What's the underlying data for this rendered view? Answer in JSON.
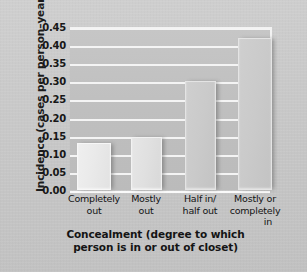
{
  "chart_data": {
    "type": "bar",
    "title": "",
    "xlabel": "Concealment (degree to which person is in or out of closet)",
    "ylabel": "Incidence (cases per person–year)",
    "categories": [
      "Completely out",
      "Mostly out",
      "Half in/ half out",
      "Mostly or completely in"
    ],
    "category_lines": [
      {
        "line1": "Completely",
        "line2": "out",
        "line3": ""
      },
      {
        "line1": "Mostly",
        "line2": "out",
        "line3": ""
      },
      {
        "line1": "Half in/",
        "line2": "half out",
        "line3": ""
      },
      {
        "line1": "Mostly or",
        "line2": "completely",
        "line3": "in"
      }
    ],
    "values": [
      0.13,
      0.145,
      0.3,
      0.42
    ],
    "ylim": [
      0.0,
      0.45
    ],
    "yticks": [
      "0.00",
      "0.05",
      "0.10",
      "0.15",
      "0.20",
      "0.25",
      "0.30",
      "0.35",
      "0.40",
      "0.45"
    ],
    "ytick_values": [
      0.0,
      0.05,
      0.1,
      0.15,
      0.2,
      0.25,
      0.3,
      0.35,
      0.4,
      0.45
    ],
    "grid": true,
    "grid_axis": "y",
    "legend": "none",
    "bar_colors": [
      "#ebebeb",
      "#e1e1e1",
      "#cacaca",
      "#cacaca"
    ],
    "plot_background": "#c2c2c2",
    "gridline_color": "#f4f4f4",
    "figure_background": "#c9c9c9"
  },
  "xlabel_lines": {
    "line1": "Concealment (degree to which",
    "line2": "person is in or out of closet)"
  }
}
